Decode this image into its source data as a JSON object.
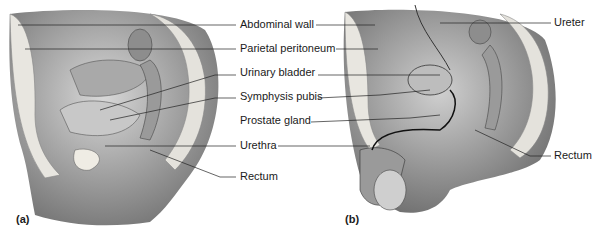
{
  "figure": {
    "panels": [
      {
        "id": "a",
        "label": "(a)",
        "subject": "female pelvis, sagittal section"
      },
      {
        "id": "b",
        "label": "(b)",
        "subject": "male pelvis, sagittal section"
      }
    ],
    "center_labels": [
      {
        "text": "Abdominal wall",
        "y": 25
      },
      {
        "text": "Parietal peritoneum",
        "y": 48
      },
      {
        "text": "Urinary bladder",
        "y": 72
      },
      {
        "text": "Symphysis pubis",
        "y": 96
      },
      {
        "text": "Prostate gland",
        "y": 120
      },
      {
        "text": "Urethra",
        "y": 144
      },
      {
        "text": "Rectum",
        "y": 175
      }
    ],
    "right_labels": [
      {
        "text": "Ureter",
        "y": 23
      },
      {
        "text": "Rectum",
        "y": 156
      }
    ]
  }
}
